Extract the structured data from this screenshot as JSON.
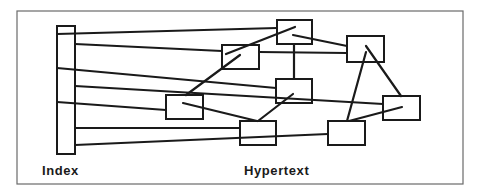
{
  "diagram": {
    "labels": {
      "index": "Index",
      "hypertext": "Hypertext"
    },
    "index_bar": {
      "id": "index"
    },
    "nodes": [
      {
        "id": "n1",
        "name": "hypertext-node-top"
      },
      {
        "id": "n2",
        "name": "hypertext-node-upper-left"
      },
      {
        "id": "n3",
        "name": "hypertext-node-upper-right"
      },
      {
        "id": "n4",
        "name": "hypertext-node-center"
      },
      {
        "id": "n5",
        "name": "hypertext-node-middle-left"
      },
      {
        "id": "n6",
        "name": "hypertext-node-right"
      },
      {
        "id": "n7",
        "name": "hypertext-node-bottom-center"
      },
      {
        "id": "n8",
        "name": "hypertext-node-bottom-right"
      }
    ],
    "index_links": [
      {
        "from": "index",
        "to": "n1"
      },
      {
        "from": "index",
        "to": "n2"
      },
      {
        "from": "index",
        "to": "n4"
      },
      {
        "from": "index",
        "to": "n6"
      },
      {
        "from": "index",
        "to": "n5"
      },
      {
        "from": "index",
        "to": "n7"
      },
      {
        "from": "index",
        "to": "n8"
      }
    ],
    "node_links": [
      {
        "from": "n1",
        "to": "n2"
      },
      {
        "from": "n1",
        "to": "n3"
      },
      {
        "from": "n2",
        "to": "n3"
      },
      {
        "from": "n1",
        "to": "n4"
      },
      {
        "from": "n2",
        "to": "n5"
      },
      {
        "from": "n3",
        "to": "n6"
      },
      {
        "from": "n3",
        "to": "n8"
      },
      {
        "from": "n5",
        "to": "n7"
      },
      {
        "from": "n4",
        "to": "n7"
      },
      {
        "from": "n6",
        "to": "n8"
      }
    ]
  }
}
